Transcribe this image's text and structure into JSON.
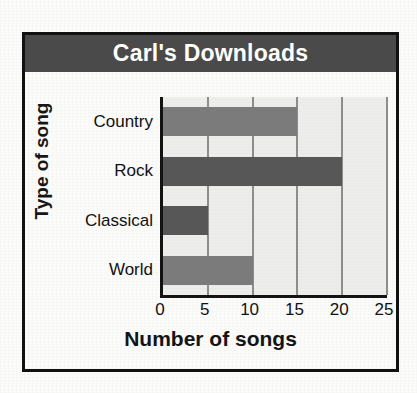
{
  "chart_data": {
    "type": "bar",
    "orientation": "horizontal",
    "title": "Carl's Downloads",
    "xlabel": "Number of songs",
    "ylabel": "Type of song",
    "categories": [
      "Country",
      "Rock",
      "Classical",
      "World"
    ],
    "values": [
      15,
      20,
      5,
      10
    ],
    "xlim": [
      0,
      25
    ],
    "xticks": [
      0,
      5,
      10,
      15,
      20,
      25
    ],
    "xtick_labels": [
      "0",
      "5",
      "10",
      "15",
      "20",
      "25"
    ],
    "grid": "vertical",
    "legend": "none",
    "bar_colors": [
      "#7b7b7b",
      "#575757",
      "#575757",
      "#7b7b7b"
    ],
    "series": [
      {
        "name": "Downloads",
        "values": [
          15,
          20,
          5,
          10
        ]
      }
    ]
  },
  "colors": {
    "title_banner": "#4a4a4a",
    "title_text": "#ffffff",
    "plot_background": "#ededeb",
    "gridline": "#8d8d8d",
    "axis": "#131313",
    "frame": "#111111",
    "page_background": "#fbfbfa"
  }
}
